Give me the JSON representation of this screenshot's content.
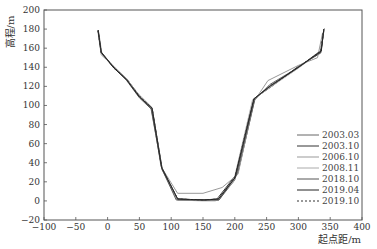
{
  "chart_data": {
    "type": "line",
    "title": "",
    "xlabel": "起点距/m",
    "ylabel": "高程/m",
    "xlim": [
      -100,
      400
    ],
    "ylim": [
      -20,
      200
    ],
    "xticks": [
      -100,
      -50,
      0,
      50,
      100,
      150,
      200,
      250,
      300,
      350,
      400
    ],
    "yticks": [
      -20,
      0,
      20,
      40,
      60,
      80,
      100,
      120,
      140,
      160,
      180,
      200
    ],
    "grid": false,
    "legend_position": "lower right",
    "series": [
      {
        "name": "2003.03",
        "color": "#666666",
        "dash": "",
        "points": [
          [
            -15,
            178
          ],
          [
            -10,
            156
          ],
          [
            10,
            140
          ],
          [
            30,
            128
          ],
          [
            50,
            110
          ],
          [
            68,
            98
          ],
          [
            85,
            35
          ],
          [
            110,
            2
          ],
          [
            150,
            1
          ],
          [
            175,
            1
          ],
          [
            200,
            22
          ],
          [
            230,
            105
          ],
          [
            255,
            122
          ],
          [
            300,
            140
          ],
          [
            336,
            158
          ],
          [
            340,
            180
          ]
        ]
      },
      {
        "name": "2003.10",
        "color": "#333333",
        "dash": "",
        "points": [
          [
            -15,
            179
          ],
          [
            -10,
            155
          ],
          [
            10,
            139
          ],
          [
            30,
            127
          ],
          [
            50,
            109
          ],
          [
            70,
            97
          ],
          [
            86,
            33
          ],
          [
            110,
            2
          ],
          [
            150,
            1
          ],
          [
            172,
            2
          ],
          [
            205,
            30
          ],
          [
            232,
            108
          ],
          [
            258,
            120
          ],
          [
            300,
            141
          ],
          [
            335,
            155
          ],
          [
            340,
            178
          ]
        ]
      },
      {
        "name": "2006.10",
        "color": "#999999",
        "dash": "",
        "points": [
          [
            -14,
            177
          ],
          [
            -9,
            154
          ],
          [
            10,
            140
          ],
          [
            30,
            128
          ],
          [
            50,
            110
          ],
          [
            70,
            96
          ],
          [
            84,
            36
          ],
          [
            110,
            8
          ],
          [
            150,
            8
          ],
          [
            180,
            14
          ],
          [
            205,
            28
          ],
          [
            230,
            104
          ],
          [
            252,
            126
          ],
          [
            300,
            142
          ],
          [
            330,
            150
          ],
          [
            338,
            176
          ]
        ]
      },
      {
        "name": "2008.11",
        "color": "#aaaaaa",
        "dash": "",
        "points": [
          [
            -15,
            176
          ],
          [
            -10,
            153
          ],
          [
            10,
            141
          ],
          [
            30,
            127
          ],
          [
            50,
            111
          ],
          [
            70,
            98
          ],
          [
            86,
            32
          ],
          [
            110,
            1
          ],
          [
            150,
            0
          ],
          [
            170,
            0
          ],
          [
            198,
            20
          ],
          [
            228,
            106
          ],
          [
            260,
            121
          ],
          [
            300,
            139
          ],
          [
            334,
            156
          ],
          [
            341,
            181
          ]
        ]
      },
      {
        "name": "2018.10",
        "color": "#555555",
        "dash": "",
        "points": [
          [
            -15,
            178
          ],
          [
            -10,
            155
          ],
          [
            10,
            140
          ],
          [
            30,
            126
          ],
          [
            50,
            108
          ],
          [
            69,
            96
          ],
          [
            85,
            34
          ],
          [
            108,
            1
          ],
          [
            150,
            1
          ],
          [
            175,
            1
          ],
          [
            202,
            26
          ],
          [
            231,
            107
          ],
          [
            256,
            121
          ],
          [
            300,
            140
          ],
          [
            335,
            156
          ],
          [
            340,
            179
          ]
        ]
      },
      {
        "name": "2019.04",
        "color": "#222222",
        "dash": "",
        "points": [
          [
            -15,
            179
          ],
          [
            -10,
            156
          ],
          [
            10,
            139
          ],
          [
            30,
            127
          ],
          [
            50,
            109
          ],
          [
            70,
            97
          ],
          [
            85,
            35
          ],
          [
            110,
            2
          ],
          [
            152,
            1
          ],
          [
            174,
            2
          ],
          [
            200,
            24
          ],
          [
            230,
            107
          ],
          [
            255,
            120
          ],
          [
            300,
            140
          ],
          [
            336,
            157
          ],
          [
            340,
            180
          ]
        ]
      },
      {
        "name": "2019.10",
        "color": "#333333",
        "dash": "2,2",
        "points": [
          [
            -15,
            178
          ],
          [
            -10,
            155
          ],
          [
            10,
            140
          ],
          [
            30,
            127
          ],
          [
            50,
            110
          ],
          [
            70,
            97
          ],
          [
            85,
            35
          ],
          [
            110,
            2
          ],
          [
            150,
            1
          ],
          [
            175,
            2
          ],
          [
            200,
            25
          ],
          [
            230,
            107
          ],
          [
            255,
            120
          ],
          [
            300,
            140
          ],
          [
            335,
            157
          ],
          [
            340,
            180
          ]
        ]
      }
    ]
  },
  "legend": {
    "items": [
      "2003.03",
      "2003.10",
      "2006.10",
      "2008.11",
      "2018.10",
      "2019.04",
      "2019.10"
    ]
  }
}
